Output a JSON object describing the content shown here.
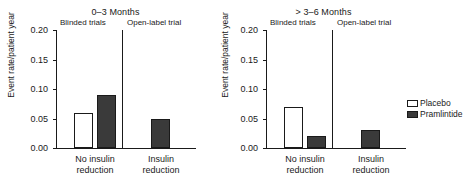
{
  "chart_data": {
    "type": "bar",
    "title": "",
    "ylabel": "Event rate/patient year",
    "xlabel": "",
    "ylim": [
      0,
      0.2
    ],
    "yticks": [
      "0.00",
      "0.05",
      "0.10",
      "0.15",
      "0.20"
    ],
    "ytick_values": [
      0,
      0.05,
      0.1,
      0.15,
      0.2
    ],
    "grid": false,
    "legend_position": "right-panel-upper-right",
    "legend": [
      "Placebo",
      "Pramlintide"
    ],
    "categories": [
      "No insulin reduction",
      "Insulin reduction"
    ],
    "panels": [
      {
        "title": "0–3 Months",
        "subpanels": [
          "Blinded trials",
          "Open-label trial"
        ],
        "groups": [
          {
            "category": "No insulin reduction",
            "category_line1": "No insulin",
            "category_line2": "reduction",
            "subpanel": "Blinded trials",
            "bars": [
              {
                "series": "Placebo",
                "value": 0.06
              },
              {
                "series": "Pramlintide",
                "value": 0.09
              }
            ]
          },
          {
            "category": "Insulin reduction",
            "category_line1": "Insulin",
            "category_line2": "reduction",
            "subpanel": "Open-label trial",
            "bars": [
              {
                "series": "Pramlintide",
                "value": 0.05
              }
            ]
          }
        ]
      },
      {
        "title": "> 3–6 Months",
        "subpanels": [
          "Blinded trials",
          "Open-label trial"
        ],
        "groups": [
          {
            "category": "No insulin reduction",
            "category_line1": "No insulin",
            "category_line2": "reduction",
            "subpanel": "Blinded trials",
            "bars": [
              {
                "series": "Placebo",
                "value": 0.07
              },
              {
                "series": "Pramlintide",
                "value": 0.02
              }
            ]
          },
          {
            "category": "Insulin reduction",
            "category_line1": "Insulin",
            "category_line2": "reduction",
            "subpanel": "Open-label trial",
            "bars": [
              {
                "series": "Pramlintide",
                "value": 0.03
              }
            ]
          }
        ]
      }
    ],
    "series": [
      {
        "name": "Placebo",
        "color": "#ffffff"
      },
      {
        "name": "Pramlintide",
        "color": "#3a3a3a"
      }
    ]
  }
}
